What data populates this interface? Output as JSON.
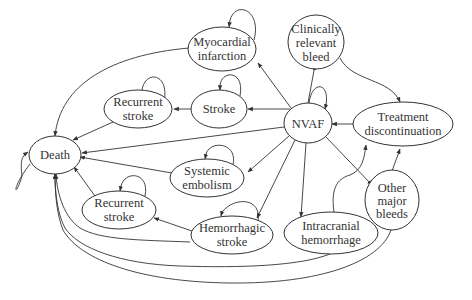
{
  "diagram": {
    "type": "state-transition",
    "nodes": {
      "mi": {
        "lines": [
          "Myocardial",
          "infarction"
        ],
        "cx": 222,
        "cy": 49,
        "rx": 34,
        "ry": 22
      },
      "crb": {
        "lines": [
          "Clinically",
          "relevant",
          "bleed"
        ],
        "cx": 316,
        "cy": 42,
        "rx": 28,
        "ry": 27
      },
      "rs_top": {
        "lines": [
          "Recurrent",
          "stroke"
        ],
        "cx": 138,
        "cy": 115,
        "rx": 34,
        "ry": 19
      },
      "stroke": {
        "lines": [
          "Stroke"
        ],
        "cx": 219,
        "cy": 109,
        "rx": 28,
        "ry": 19
      },
      "nvaf": {
        "lines": [
          "NVAF"
        ],
        "cx": 308,
        "cy": 123,
        "rx": 24,
        "ry": 20
      },
      "td": {
        "lines": [
          "Treatment",
          "discontinuation"
        ],
        "cx": 403,
        "cy": 126,
        "rx": 50,
        "ry": 22
      },
      "death": {
        "lines": [
          "Death"
        ],
        "cx": 55,
        "cy": 155,
        "rx": 26,
        "ry": 18
      },
      "se": {
        "lines": [
          "Systemic",
          "embolism"
        ],
        "cx": 207,
        "cy": 178,
        "rx": 37,
        "ry": 19
      },
      "rs_bottom": {
        "lines": [
          "Recurrent",
          "stroke"
        ],
        "cx": 119,
        "cy": 210,
        "rx": 37,
        "ry": 19
      },
      "hs": {
        "lines": [
          "Hemorrhagic",
          "stroke"
        ],
        "cx": 232,
        "cy": 235,
        "rx": 41,
        "ry": 19
      },
      "ich": {
        "lines": [
          "Intracranial",
          "hemorrhage"
        ],
        "cx": 331,
        "cy": 233,
        "rx": 47,
        "ry": 21
      },
      "omb": {
        "lines": [
          "Other",
          "major",
          "bleeds"
        ],
        "cx": 392,
        "cy": 200,
        "rx": 27,
        "ry": 30
      }
    },
    "edges": [
      {
        "from": "nvaf",
        "to": "mi"
      },
      {
        "from": "nvaf",
        "to": "crb"
      },
      {
        "from": "nvaf",
        "to": "stroke"
      },
      {
        "from": "nvaf",
        "to": "death"
      },
      {
        "from": "nvaf",
        "to": "se"
      },
      {
        "from": "nvaf",
        "to": "hs"
      },
      {
        "from": "nvaf",
        "to": "ich"
      },
      {
        "from": "nvaf",
        "to": "omb"
      },
      {
        "from": "td",
        "to": "nvaf"
      },
      {
        "from": "crb",
        "to": "td"
      },
      {
        "from": "ich",
        "to": "td"
      },
      {
        "from": "omb",
        "to": "td"
      },
      {
        "from": "stroke",
        "to": "rs_top"
      },
      {
        "from": "rs_top",
        "to": "death"
      },
      {
        "from": "mi",
        "to": "death"
      },
      {
        "from": "se",
        "to": "death"
      },
      {
        "from": "rs_bottom",
        "to": "death"
      },
      {
        "from": "hs",
        "to": "rs_bottom"
      },
      {
        "from": "hs",
        "to": "death"
      },
      {
        "from": "ich",
        "to": "death"
      },
      {
        "from": "omb",
        "to": "death"
      }
    ],
    "self_loops": [
      "mi",
      "rs_top",
      "stroke",
      "nvaf",
      "death",
      "se",
      "rs_bottom",
      "hs"
    ]
  }
}
